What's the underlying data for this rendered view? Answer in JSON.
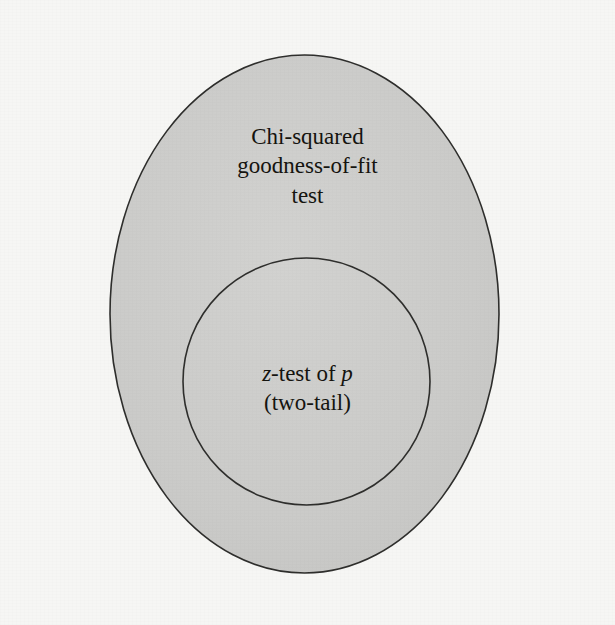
{
  "figure": {
    "type": "nested-set-venn-diagram",
    "background_color": "#f6f6f4",
    "outer_set": {
      "shape": "ellipse",
      "fill_color": "#cbcbc9",
      "stroke_color": "#2e2e2c",
      "label_lines": [
        "Chi-squared",
        "goodness-of-fit",
        "test"
      ]
    },
    "inner_set": {
      "shape": "circle",
      "fill_color": "#cbcbc9",
      "stroke_color": "#2e2e2c",
      "label_line_1_prefix": "z",
      "label_line_1_middle": "-test of ",
      "label_line_1_variable": "p",
      "label_line_2": "(two-tail)"
    }
  }
}
